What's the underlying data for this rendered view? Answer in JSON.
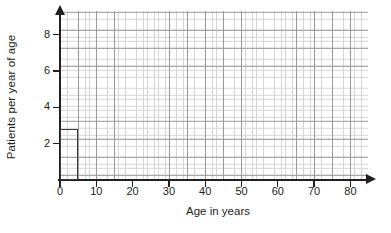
{
  "chart_data": {
    "type": "bar",
    "title": "",
    "subtitle": "",
    "xlabel": "Age in years",
    "ylabel": "Patients per year of age",
    "xlim": [
      0,
      85
    ],
    "ylim": [
      0,
      9.3
    ],
    "xticks": [
      0,
      10,
      20,
      30,
      40,
      50,
      60,
      70,
      80
    ],
    "xtick_labels": [
      "0",
      "10",
      "20",
      "30",
      "40",
      "50",
      "60",
      "70",
      "80"
    ],
    "yticks": [
      2,
      4,
      6,
      8
    ],
    "ytick_labels": [
      "2",
      "4",
      "6",
      "8"
    ],
    "grid": true,
    "grid_minor": true,
    "legend": null,
    "annotations": [],
    "bars": [
      {
        "label": "0-5",
        "x_start": 0,
        "x_end": 5,
        "value": 2.8
      }
    ],
    "categories": [
      "0–5"
    ],
    "values": [
      2.8
    ],
    "colors": {
      "bar_edge": "#3b3b3b",
      "bar_fill": "transparent",
      "axis": "#231f20",
      "grid_major": "#9a9a9a",
      "grid_minor": "#d6d6d6",
      "background": "#ffffff",
      "text": "#231f20"
    }
  }
}
